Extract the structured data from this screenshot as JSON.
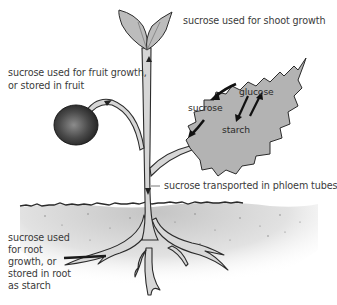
{
  "diagram": {
    "colors": {
      "background": "#ffffff",
      "leaf_fill": "#b5b5b5",
      "stem_fill": "#d4d4d4",
      "fruit_dark": "#2a2a2a",
      "fruit_light": "#8c8c8c",
      "soil_fill": "#cfcfcf",
      "outline": "#2b2b2b",
      "text": "#3a3a3a"
    },
    "labels": {
      "shoot": "sucrose used for shoot growth",
      "fruit_line1": "sucrose used for fruit growth,",
      "fruit_line2": "or stored in fruit",
      "phloem": "sucrose transported in phloem tubes",
      "root_line1": "sucrose used",
      "root_line2": "for root",
      "root_line3": "growth, or",
      "root_line4": "stored in root",
      "root_line5": "as starch"
    },
    "leaf_labels": {
      "glucose": "glucose",
      "sucrose": "sucrose",
      "starch": "starch"
    },
    "parts": [
      "shoot tip",
      "stem",
      "fruit",
      "leaf",
      "soil surface",
      "roots"
    ],
    "flows": [
      {
        "from": "glucose",
        "to": "sucrose"
      },
      {
        "from": "glucose",
        "to": "starch"
      },
      {
        "from": "starch",
        "to": "glucose"
      },
      {
        "from": "sucrose",
        "to": "stem"
      },
      {
        "from": "stem",
        "to": "shoot tip"
      },
      {
        "from": "stem",
        "to": "fruit"
      },
      {
        "from": "stem",
        "to": "roots"
      }
    ]
  }
}
